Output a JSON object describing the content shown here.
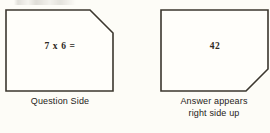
{
  "figure": {
    "title_fragment_visible": false,
    "background_color": "#fdfcf7",
    "stroke_color": "#3b362e",
    "fill_color": "#fffefa"
  },
  "cards": [
    {
      "id": "question",
      "name": "flashcard-question",
      "text": "7 x 6 =",
      "clipped_corner": "top-right",
      "caption_lines": [
        "Question Side"
      ]
    },
    {
      "id": "answer",
      "name": "flashcard-answer",
      "text": "42",
      "clipped_corner": "bottom-right",
      "caption_lines": [
        "Answer appears",
        "right side up"
      ]
    }
  ]
}
